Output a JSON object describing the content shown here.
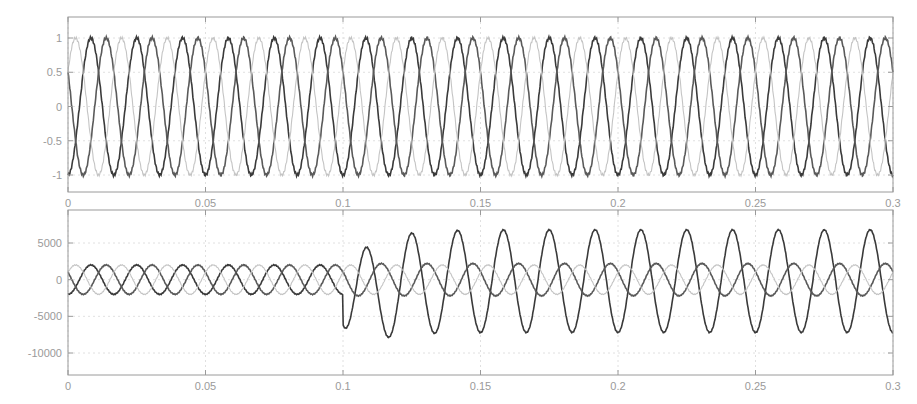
{
  "chart_data": [
    {
      "type": "line",
      "title": "",
      "xlabel": "",
      "ylabel": "",
      "xlim": [
        0,
        0.3
      ],
      "ylim": [
        -1.2,
        1.2
      ],
      "grid": true,
      "legend": null,
      "x_ticks": [
        0,
        0.05,
        0.1,
        0.15,
        0.2,
        0.25,
        0.3
      ],
      "x_tick_labels": [
        "0",
        "0.05",
        "0.1",
        "0.15",
        "0.2",
        "0.25",
        "0.3"
      ],
      "y_ticks": [
        1,
        0.5,
        0,
        -0.5,
        -1
      ],
      "y_tick_labels": [
        "1",
        "0.5",
        "0",
        "-0.5",
        "-1"
      ],
      "frequency_hz": 60,
      "series": [
        {
          "name": "phase-a",
          "amplitude": 1.0,
          "phase_deg": -90,
          "color": "#3a3a3a"
        },
        {
          "name": "phase-b",
          "amplitude": 1.0,
          "phase_deg": 150,
          "color": "#5a5a5a"
        },
        {
          "name": "phase-c",
          "amplitude": 1.0,
          "phase_deg": 30,
          "color": "#c4c4c4"
        }
      ]
    },
    {
      "type": "line",
      "title": "",
      "xlabel": "",
      "ylabel": "",
      "xlim": [
        0,
        0.3
      ],
      "ylim": [
        -13000,
        9000
      ],
      "grid": true,
      "legend": null,
      "x_ticks": [
        0,
        0.05,
        0.1,
        0.15,
        0.2,
        0.25,
        0.3
      ],
      "x_tick_labels": [
        "0",
        "0.05",
        "0.1",
        "0.15",
        "0.2",
        "0.25",
        "0.3"
      ],
      "y_ticks": [
        5000,
        0,
        -5000,
        -10000
      ],
      "y_tick_labels": [
        "5000",
        "0",
        "-5000",
        "-10000"
      ],
      "frequency_hz": 60,
      "event_time": 0.1,
      "series": [
        {
          "name": "phase-a",
          "amplitude_pre": 2000,
          "amplitude_post": 7000,
          "offset_post": -200,
          "transient_min": -11000,
          "phase_deg": -90,
          "color": "#3a3a3a"
        },
        {
          "name": "phase-b",
          "amplitude_pre": 2000,
          "amplitude_post": 2200,
          "phase_deg": 150,
          "color": "#5a5a5a"
        },
        {
          "name": "phase-c",
          "amplitude_pre": 2000,
          "amplitude_post": 2000,
          "phase_deg": 30,
          "color": "#c4c4c4"
        }
      ]
    }
  ]
}
